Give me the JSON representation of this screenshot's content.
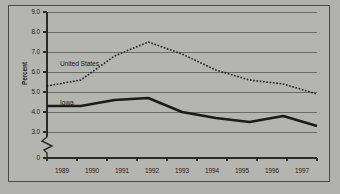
{
  "chart_data": {
    "type": "line",
    "title": "",
    "subtitle": "",
    "xlabel": "",
    "ylabel": "Percent",
    "categories": [
      "1989",
      "1990",
      "1991",
      "1992",
      "1993",
      "1994",
      "1995",
      "1996",
      "1997"
    ],
    "series": [
      {
        "name": "United States",
        "style": "dotted",
        "values": [
          5.3,
          5.6,
          6.8,
          7.5,
          6.9,
          6.1,
          5.6,
          5.4,
          4.9
        ]
      },
      {
        "name": "Iowa",
        "style": "solid",
        "values": [
          4.3,
          4.3,
          4.6,
          4.7,
          4.0,
          3.7,
          3.5,
          3.8,
          3.3
        ]
      }
    ],
    "ylim": [
      3.0,
      9.0
    ],
    "y_ticks": [
      "0",
      "3.0",
      "4.0",
      "5.0",
      "6.0",
      "7.0",
      "8.0",
      "9.0"
    ],
    "y_axis_break": true,
    "y_axis_break_note": "axis broken between 0 and 3.0",
    "grid": true,
    "grid_axis": "y",
    "legend": "inline-labels",
    "legend_position": "inside-plot-left",
    "colors": {
      "background": "#b4b4b0",
      "outer_background": "#b0b0ac",
      "gridline": "#6b6b68",
      "axis": "#2a2a28",
      "series_united_states": "#1b1b1b",
      "series_iowa": "#1b1b1b",
      "text": "#1b1b1b",
      "frame": "#4a4a48"
    }
  },
  "annotations": {
    "series_label_us": "United States",
    "series_label_iowa": "Iowa"
  }
}
